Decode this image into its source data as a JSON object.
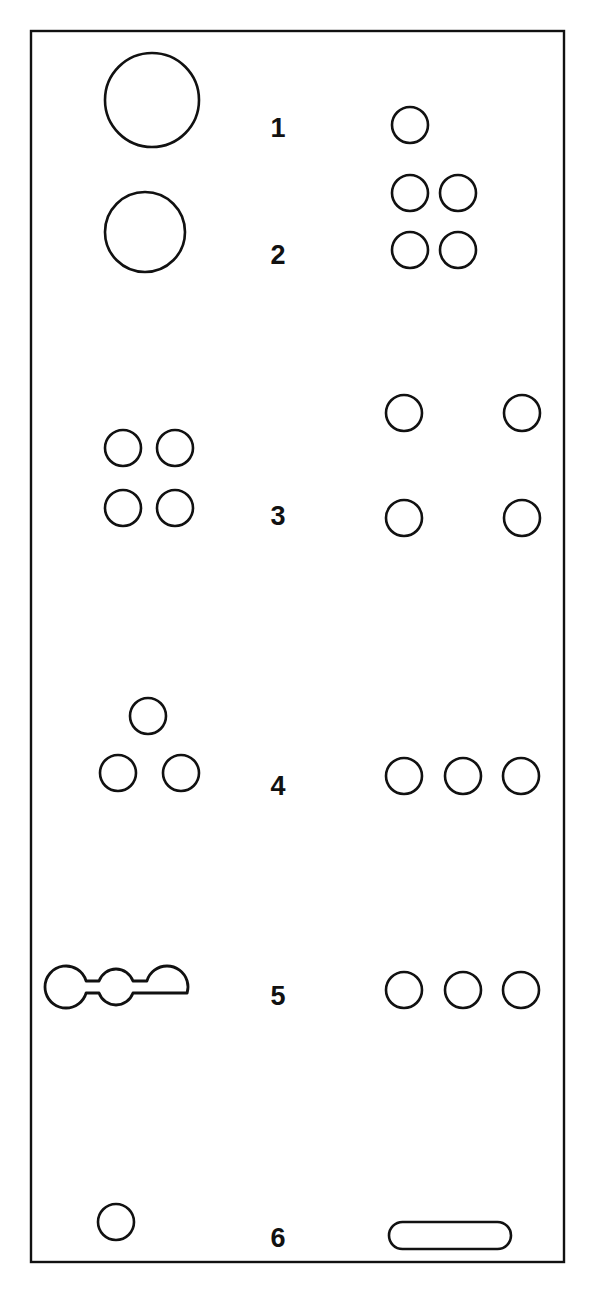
{
  "figure": {
    "background_color": "#ffffff",
    "stroke_color": "#111111",
    "frame": {
      "x": 31,
      "y": 31,
      "width": 533,
      "height": 1231
    },
    "label_column_x": 278,
    "rows": [
      {
        "number": "1",
        "label_y": 128,
        "left": {
          "arrangement": "single-large-circle",
          "count": 1,
          "circles": [
            {
              "cx": 152,
              "cy": 100,
              "r": 47
            }
          ]
        },
        "right": {
          "arrangement": "single-small-circle",
          "count": 1,
          "circles": [
            {
              "cx": 410,
              "cy": 125,
              "r": 18
            }
          ]
        }
      },
      {
        "number": "2",
        "label_y": 255,
        "left": {
          "arrangement": "single-large-circle",
          "count": 1,
          "circles": [
            {
              "cx": 145,
              "cy": 232,
              "r": 40
            }
          ]
        },
        "right": {
          "arrangement": "two-by-two-grid",
          "count": 4,
          "circles": [
            {
              "cx": 410,
              "cy": 193,
              "r": 18
            },
            {
              "cx": 458,
              "cy": 193,
              "r": 18
            },
            {
              "cx": 410,
              "cy": 250,
              "r": 18
            },
            {
              "cx": 458,
              "cy": 250,
              "r": 18
            }
          ]
        }
      },
      {
        "number": "3",
        "label_y": 516,
        "left": {
          "arrangement": "two-by-two-grid",
          "count": 4,
          "circles": [
            {
              "cx": 123,
              "cy": 448,
              "r": 18
            },
            {
              "cx": 175,
              "cy": 448,
              "r": 18
            },
            {
              "cx": 123,
              "cy": 508,
              "r": 18
            },
            {
              "cx": 175,
              "cy": 508,
              "r": 18
            }
          ]
        },
        "right": {
          "arrangement": "wide-two-by-two-grid",
          "count": 4,
          "circles": [
            {
              "cx": 404,
              "cy": 413,
              "r": 18
            },
            {
              "cx": 522,
              "cy": 413,
              "r": 18
            },
            {
              "cx": 404,
              "cy": 518,
              "r": 18
            },
            {
              "cx": 522,
              "cy": 518,
              "r": 18
            }
          ]
        }
      },
      {
        "number": "4",
        "label_y": 786,
        "left": {
          "arrangement": "triangle",
          "count": 3,
          "circles": [
            {
              "cx": 148,
              "cy": 716,
              "r": 18
            },
            {
              "cx": 118,
              "cy": 773,
              "r": 18
            },
            {
              "cx": 181,
              "cy": 773,
              "r": 18
            }
          ]
        },
        "right": {
          "arrangement": "horizontal-row",
          "count": 3,
          "circles": [
            {
              "cx": 404,
              "cy": 776,
              "r": 18
            },
            {
              "cx": 463,
              "cy": 776,
              "r": 18
            },
            {
              "cx": 521,
              "cy": 776,
              "r": 18
            }
          ]
        }
      },
      {
        "number": "5",
        "label_y": 996,
        "left": {
          "arrangement": "chain-of-three-connected-circles",
          "count": 3,
          "chain": {
            "circles": [
              {
                "cx": 66,
                "cy": 987,
                "r": 21
              },
              {
                "cx": 116,
                "cy": 987,
                "r": 18
              },
              {
                "cx": 167,
                "cy": 987,
                "r": 21
              }
            ],
            "neck_half_height": 6
          }
        },
        "right": {
          "arrangement": "horizontal-row",
          "count": 3,
          "circles": [
            {
              "cx": 404,
              "cy": 990,
              "r": 18
            },
            {
              "cx": 463,
              "cy": 990,
              "r": 18
            },
            {
              "cx": 521,
              "cy": 990,
              "r": 18
            }
          ]
        }
      },
      {
        "number": "6",
        "label_y": 1238,
        "left": {
          "arrangement": "single-small-circle",
          "count": 1,
          "circles": [
            {
              "cx": 116,
              "cy": 1222,
              "r": 18
            }
          ]
        },
        "right": {
          "arrangement": "stadium-pill",
          "count": 1,
          "stadium": {
            "x": 389,
            "y": 1222,
            "width": 122,
            "height": 27,
            "rx": 13.5
          }
        }
      }
    ]
  }
}
